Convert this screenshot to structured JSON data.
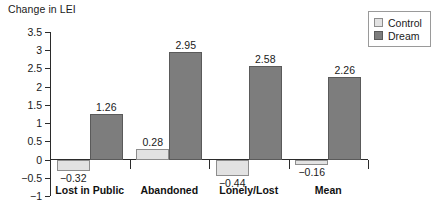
{
  "chart_data": {
    "type": "bar",
    "title": "Change in LEI",
    "xlabel": "",
    "ylabel": "Change in LEI",
    "ylim": [
      -1,
      3.5
    ],
    "ytick_labels": [
      "3.5",
      "3",
      "2.5",
      "2",
      "1.5",
      "1",
      "0.5",
      "0",
      "−0.5",
      "−1"
    ],
    "ytick_values": [
      3.5,
      3,
      2.5,
      2,
      1.5,
      1,
      0.5,
      0,
      -0.5,
      -1
    ],
    "grid": false,
    "legend_position": "top-right",
    "categories": [
      "Lost in Public",
      "Abandoned",
      "Lonely/Lost",
      "Mean"
    ],
    "series": [
      {
        "name": "Control",
        "color": "#e2e2e2",
        "values": [
          -0.32,
          0.28,
          -0.44,
          -0.16
        ],
        "value_labels": [
          "−0.32",
          "0.28",
          "−0.44",
          "−0.16"
        ]
      },
      {
        "name": "Dream",
        "color": "#7d7d7d",
        "values": [
          1.26,
          2.95,
          2.58,
          2.26
        ],
        "value_labels": [
          "1.26",
          "2.95",
          "2.58",
          "2.26"
        ]
      }
    ]
  },
  "legend": {
    "items": [
      {
        "label": "Control",
        "swatch": "control"
      },
      {
        "label": "Dream",
        "swatch": "dream"
      }
    ]
  }
}
